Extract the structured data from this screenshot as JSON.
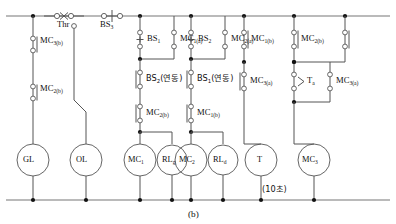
{
  "figure": {
    "caption": "(b)",
    "type": "ladder-control-circuit",
    "note_timer": "(10ì´Ī)"
  },
  "top_rail": {
    "contacts": [
      {
        "id": "thr",
        "label": "Thr",
        "kind": "nc-thermal-overload",
        "x": 88
      },
      {
        "id": "bs3",
        "label_main": "BS",
        "label_sub": "3",
        "kind": "nc-pushbutton",
        "x": 140
      }
    ]
  },
  "branches": [
    {
      "id": "branch-gl",
      "coil": {
        "label_main": "GL",
        "label_sub": "",
        "kind": "lamp"
      },
      "contacts": [
        {
          "label_main": "MC",
          "label_sub": "3(b)",
          "kind": "nc"
        },
        {
          "label_main": "MC",
          "label_sub": "2(b)",
          "kind": "nc"
        }
      ]
    },
    {
      "id": "branch-ol",
      "coil": {
        "label_main": "OL",
        "label_sub": "",
        "kind": "lamp"
      },
      "contacts": []
    },
    {
      "id": "branch-mc1",
      "coil": {
        "label_main": "MC",
        "label_sub": "1",
        "kind": "contactor-coil"
      },
      "start": {
        "label_main": "BS",
        "label_sub": "1",
        "kind": "no-pushbutton"
      },
      "seal": {
        "label_main": "MC",
        "label_sub": "1(a)",
        "kind": "no"
      },
      "interlock_series": [
        {
          "label_main": "BS",
          "label_sub": "2",
          "suffix": "(연동)",
          "kind": "nc"
        },
        {
          "label_main": "MC",
          "label_sub": "2(b)",
          "kind": "nc"
        }
      ]
    },
    {
      "id": "branch-rlg",
      "coil": {
        "label_main": "RL",
        "label_sub": "g",
        "kind": "lamp"
      },
      "contacts": []
    },
    {
      "id": "branch-mc2",
      "coil": {
        "label_main": "MC",
        "label_sub": "2",
        "kind": "contactor-coil"
      },
      "start": {
        "label_main": "BS",
        "label_sub": "2",
        "kind": "no-pushbutton"
      },
      "seal": {
        "label_main": "MC",
        "label_sub": "2(a)",
        "kind": "no"
      },
      "interlock_series": [
        {
          "label_main": "BS",
          "label_sub": "1",
          "suffix": "(연동)",
          "kind": "nc"
        },
        {
          "label_main": "MC",
          "label_sub": "1(b)",
          "kind": "nc"
        }
      ]
    },
    {
      "id": "branch-rld",
      "coil": {
        "label_main": "RL",
        "label_sub": "d",
        "kind": "lamp"
      },
      "contacts": []
    },
    {
      "id": "branch-timer",
      "coil": {
        "label_main": "T",
        "label_sub": "",
        "kind": "timer-coil"
      },
      "contacts": [
        {
          "label_main": "MC",
          "label_sub": "1(b)",
          "kind": "nc"
        },
        {
          "label_main": "MC",
          "label_sub": "3(a)",
          "kind": "no"
        }
      ],
      "note": "(10ì´Ī)"
    },
    {
      "id": "branch-mc3",
      "coil": {
        "label_main": "MC",
        "label_sub": "3",
        "kind": "contactor-coil"
      },
      "contacts": [
        {
          "label_main": "MC",
          "label_sub": "2(b)",
          "kind": "nc"
        },
        {
          "label_main": "T",
          "label_sub": "a",
          "kind": "timer-no-delay"
        },
        {
          "label_main": "MC",
          "label_sub": "3(a)",
          "kind": "no"
        }
      ]
    }
  ],
  "labels": {
    "thr": "Thr",
    "bs3": "BS",
    "bs3_sub": "3",
    "bs1": "BS",
    "bs1_sub": "1",
    "bs2": "BS",
    "bs2_sub": "2",
    "mc1a": "MC",
    "mc1a_sub": "1(a)",
    "mc2a": "MC",
    "mc2a_sub": "2(a)",
    "mc1b_top": "MC",
    "mc1b_top_sub": "1(b)",
    "mc2b_top": "MC",
    "mc2b_top_sub": "2(b)",
    "mc3b_left": "MC",
    "mc3b_left_sub": "3(b)",
    "mc2b_left": "MC",
    "mc2b_left_sub": "2(b)",
    "bs2_yeondong": "BS",
    "bs2_yeondong_sub": "2",
    "bs2_yeondong_suffix": "(연동)",
    "bs1_yeondong": "BS",
    "bs1_yeondong_sub": "1",
    "bs1_yeondong_suffix": "(연동)",
    "mc2b_mid": "MC",
    "mc2b_mid_sub": "2(b)",
    "mc1b_mid": "MC",
    "mc1b_mid_sub": "1(b)",
    "mc3a_mid": "MC",
    "mc3a_mid_sub": "3(a)",
    "ta": "T",
    "ta_sub": "a",
    "mc3a_right": "MC",
    "mc3a_right_sub": "3(a)",
    "gl": "GL",
    "ol": "OL",
    "mc1_coil": "MC",
    "mc1_coil_sub": "1",
    "rlg": "RL",
    "rlg_sub": "g",
    "mc2_coil": "MC",
    "mc2_coil_sub": "2",
    "rld": "RL",
    "rld_sub": "d",
    "t_coil": "T",
    "mc3_coil": "MC",
    "mc3_coil_sub": "3",
    "timer_note": "(10초)",
    "caption": "(b)"
  },
  "colors": {
    "line": "#4a4a4a",
    "rail": "#6e6e6e",
    "text": "#111111",
    "node": "#1a1a1a",
    "background": "#ffffff"
  }
}
